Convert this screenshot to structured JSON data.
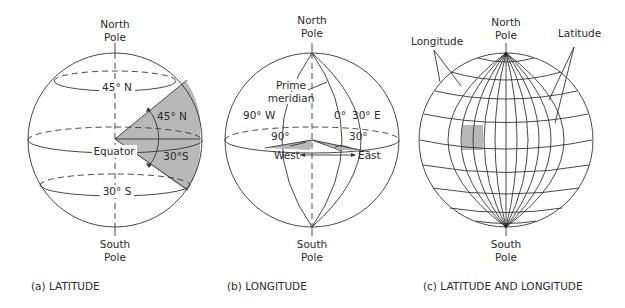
{
  "figure": {
    "panels": [
      {
        "id": "a",
        "caption": "(a) LATITUDE",
        "labels": {
          "north_pole_1": "North",
          "north_pole_2": "Pole",
          "south_pole_1": "South",
          "south_pole_2": "Pole",
          "parallel_north": "45° N",
          "angle_north": "45° N",
          "equator": "Equator",
          "angle_south": "30°S",
          "parallel_south": "30° S"
        }
      },
      {
        "id": "b",
        "caption": "(b) LONGITUDE",
        "labels": {
          "north_pole_1": "North",
          "north_pole_2": "Pole",
          "south_pole_1": "South",
          "south_pole_2": "Pole",
          "prime_1": "Prime",
          "prime_2": "meridian",
          "west_meridian": "90° W",
          "zero": "0°",
          "east_meridian": "30° E",
          "angle_west": "90°",
          "angle_east": "30°",
          "west": "West",
          "east": "East"
        }
      },
      {
        "id": "c",
        "caption": "(c) LATITUDE AND LONGITUDE",
        "labels": {
          "north_pole_1": "North",
          "north_pole_2": "Pole",
          "south_pole_1": "South",
          "south_pole_2": "Pole",
          "longitude": "Longitude",
          "latitude": "Latitude"
        }
      }
    ],
    "colors": {
      "line": "#333333",
      "shade": "#b8b8b8",
      "background": "#ffffff"
    }
  }
}
